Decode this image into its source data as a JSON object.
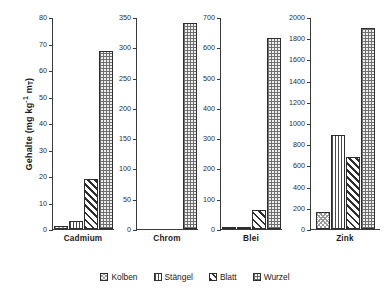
{
  "chart_data": {
    "type": "bar",
    "title": "",
    "subtitle": "",
    "xlabel": "",
    "ylabel": "Gehalte (mg kg-1 mT)",
    "ylabel_parts": {
      "main": "Gehalte (mg kg",
      "exponent": "-1",
      "mid": " m",
      "subscript": "T",
      "tail": ")"
    },
    "grid": false,
    "legend_position": "bottom",
    "categories": [
      "Cadmium",
      "Chrom",
      "Blei",
      "Zink"
    ],
    "series": [
      {
        "name": "Kolben",
        "pattern": "light-checker",
        "values": [
          1,
          0,
          6,
          165
        ]
      },
      {
        "name": "Stängel",
        "pattern": "vertical-lines",
        "values": [
          3,
          0,
          6,
          885
        ]
      },
      {
        "name": "Blatt",
        "pattern": "diagonal-hatch",
        "values": [
          19,
          0,
          62,
          680
        ]
      },
      {
        "name": "Wurzel",
        "pattern": "cross-dot-grid",
        "values": [
          67,
          340,
          630,
          1900
        ]
      }
    ],
    "panels": [
      {
        "category": "Cadmium",
        "ylim": [
          0,
          80
        ],
        "ytick_step": 10,
        "yticks": [
          0,
          10,
          20,
          30,
          40,
          50,
          60,
          70,
          80
        ]
      },
      {
        "category": "Chrom",
        "ylim": [
          0,
          350
        ],
        "ytick_step": 50,
        "yticks": [
          0,
          50,
          100,
          150,
          200,
          250,
          300,
          350
        ]
      },
      {
        "category": "Blei",
        "ylim": [
          0,
          700
        ],
        "ytick_step": 100,
        "yticks": [
          0,
          100,
          200,
          300,
          400,
          500,
          600,
          700
        ]
      },
      {
        "category": "Zink",
        "ylim": [
          0,
          2000
        ],
        "ytick_step": 200,
        "yticks": [
          0,
          200,
          400,
          600,
          800,
          1000,
          1200,
          1400,
          1600,
          1800,
          2000
        ]
      }
    ]
  },
  "legend": {
    "items": [
      {
        "label": "Kolben"
      },
      {
        "label": "Stängel"
      },
      {
        "label": "Blatt"
      },
      {
        "label": "Wurzel"
      }
    ]
  }
}
